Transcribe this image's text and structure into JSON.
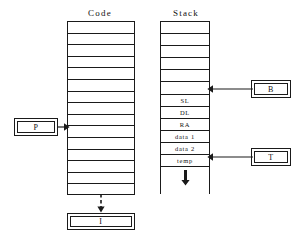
{
  "diagram": {
    "stroke_color": "#1a1a1a",
    "background_color": "#ffffff"
  },
  "code_section": {
    "title": "Code",
    "row_count": 15,
    "rows": [
      "",
      "",
      "",
      "",
      "",
      "",
      "",
      "",
      "",
      "",
      "",
      "",
      "",
      "",
      ""
    ],
    "pointer_row_index": 8
  },
  "stack_section": {
    "title": "Stack",
    "empty_row_count": 6,
    "rows": [
      {
        "label": "",
        "named": false
      },
      {
        "label": "",
        "named": false
      },
      {
        "label": "",
        "named": false
      },
      {
        "label": "",
        "named": false
      },
      {
        "label": "",
        "named": false
      },
      {
        "label": "",
        "named": false
      },
      {
        "label": "SL",
        "named": true
      },
      {
        "label": "DL",
        "named": true
      },
      {
        "label": "RA",
        "named": true
      },
      {
        "label": "data 1",
        "named": true
      },
      {
        "label": "data 2",
        "named": true
      },
      {
        "label": "temp",
        "named": true
      }
    ],
    "growth_direction_icon": "down-arrow-icon"
  },
  "pointers": {
    "p": {
      "label": "P",
      "target": "code-column",
      "direction": "right"
    },
    "b": {
      "label": "B",
      "target": "stack-row-sl",
      "direction": "left"
    },
    "t": {
      "label": "T",
      "target": "stack-row-temp",
      "direction": "left"
    },
    "i": {
      "label": "I",
      "target": "code-column-bottom",
      "direction": "down",
      "line_style": "dashed"
    }
  }
}
